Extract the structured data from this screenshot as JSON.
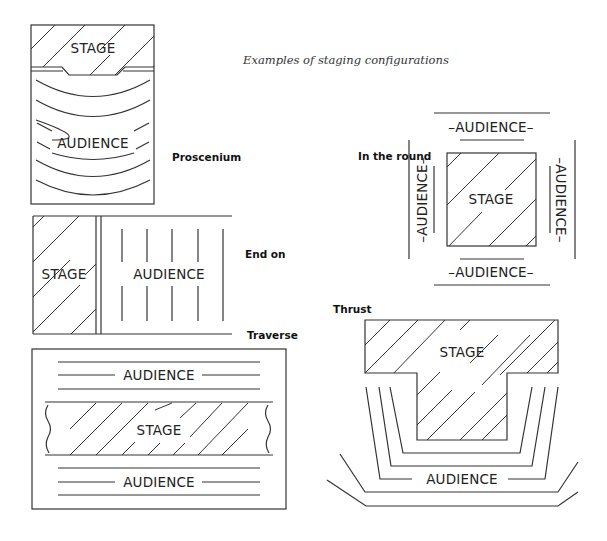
{
  "title": "Examples of staging configurations",
  "configurations": {
    "proscenium": {
      "caption": "Proscenium",
      "stage_label": "STAGE",
      "audience_label": "AUDIENCE"
    },
    "end_on": {
      "caption": "End on",
      "stage_label": "STAGE",
      "audience_label": "AUDIENCE"
    },
    "traverse": {
      "caption": "Traverse",
      "stage_label": "STAGE",
      "audience_top_label": "AUDIENCE",
      "audience_bottom_label": "AUDIENCE"
    },
    "in_the_round": {
      "caption": "In the round",
      "stage_label": "STAGE",
      "audience_top_label": "–AUDIENCE–",
      "audience_bottom_label": "–AUDIENCE–",
      "audience_left_label": "–AUDIENCE–",
      "audience_right_label": "–AUDIENCE–"
    },
    "thrust": {
      "caption": "Thrust",
      "stage_label": "STAGE",
      "audience_label": "AUDIENCE"
    }
  }
}
